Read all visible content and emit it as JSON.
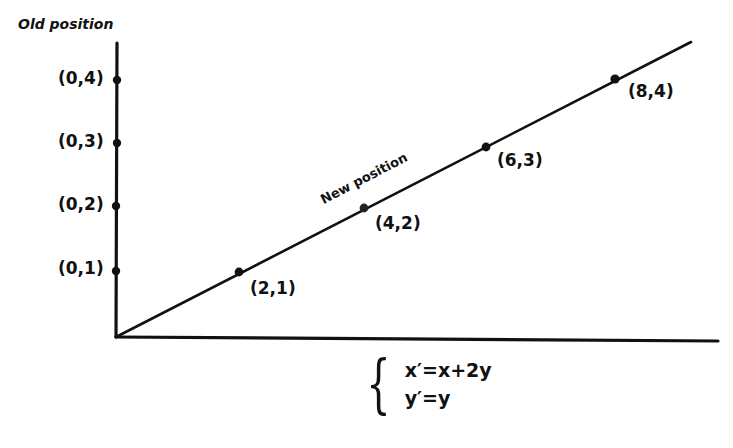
{
  "figure": {
    "y_axis_title": "Old position",
    "line_label": "New position",
    "old_points": [
      {
        "label": "(0,4)",
        "x": 0,
        "y": 4
      },
      {
        "label": "(0,3)",
        "x": 0,
        "y": 3
      },
      {
        "label": "(0,2)",
        "x": 0,
        "y": 2
      },
      {
        "label": "(0,1)",
        "x": 0,
        "y": 1
      }
    ],
    "new_points": [
      {
        "label": "(2,1)",
        "x": 2,
        "y": 1
      },
      {
        "label": "(4,2)",
        "x": 4,
        "y": 2
      },
      {
        "label": "(6,3)",
        "x": 6,
        "y": 3
      },
      {
        "label": "(8,4)",
        "x": 8,
        "y": 4
      }
    ],
    "equations": {
      "line1": "x′=x+2y",
      "line2": "y′=y"
    }
  }
}
